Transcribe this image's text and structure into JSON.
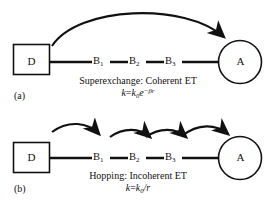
{
  "figure": {
    "background_color": "#ffffff",
    "stroke_color": "#111111",
    "panels": [
      {
        "tag": "(a)",
        "mechanism_caption": "Superexchange: Coherent ET",
        "rate_law": {
          "lhs": "k",
          "equals": "=",
          "prefactor": "k",
          "prefactor_sub": "0",
          "base": "e",
          "exponent": "−βr",
          "plain": "k = k0e^(−βr)"
        },
        "donor_label": "D",
        "acceptor_label": "A",
        "bridge_labels": [
          "B",
          "B",
          "B"
        ],
        "bridge_subscripts": [
          "1",
          "2",
          "3"
        ],
        "arrow_style": "single-long-arc",
        "arrow_count": 1
      },
      {
        "tag": "(b)",
        "mechanism_caption": "Hopping: Incoherent ET",
        "rate_law": {
          "lhs": "k",
          "equals": "=",
          "prefactor": "k",
          "prefactor_sub": "0",
          "divider": "/",
          "denominator": "r",
          "plain": "k = k0/r"
        },
        "donor_label": "D",
        "acceptor_label": "A",
        "bridge_labels": [
          "B",
          "B",
          "B"
        ],
        "bridge_subscripts": [
          "1",
          "2",
          "3"
        ],
        "arrow_style": "short-hop-arcs",
        "arrow_count": 4
      }
    ]
  }
}
